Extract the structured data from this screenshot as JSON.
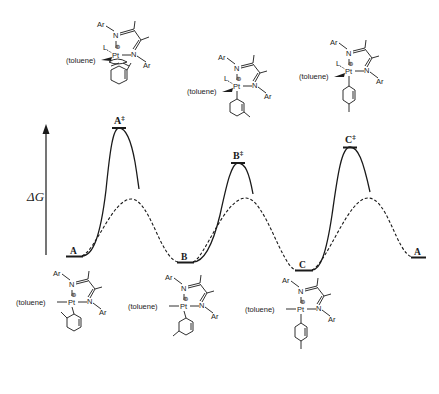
{
  "figure": {
    "type": "reaction free-energy profile",
    "axis": {
      "label": "ΔG",
      "direction": "up"
    },
    "colors": {
      "ink": "#1a1a1a",
      "background": "#ffffff"
    }
  },
  "states": {
    "A_start": {
      "label": "A",
      "x": 74,
      "y": 256
    },
    "A_ts": {
      "label": "A",
      "sup": "‡",
      "x": 119,
      "y": 127
    },
    "B": {
      "label": "B",
      "x": 185,
      "y": 262
    },
    "B_ts": {
      "label": "B",
      "sup": "‡",
      "x": 238,
      "y": 162
    },
    "C": {
      "label": "C",
      "x": 304,
      "y": 270
    },
    "C_ts": {
      "label": "C",
      "sup": "‡",
      "x": 350,
      "y": 147
    },
    "A_end": {
      "label": "A",
      "x": 418,
      "y": 257
    }
  },
  "curves": {
    "solid": {
      "style": "solid",
      "meaning": "uncatalyzed / higher barrier path"
    },
    "dashed": {
      "style": "dashed",
      "meaning": "lower barrier path"
    }
  },
  "structures": {
    "common": {
      "metal": "Pt",
      "charge": "⊕",
      "ligand_label": "(toluene)",
      "aryl_label": "Ar",
      "n_label": "N",
      "l_label": "L"
    },
    "A_ts": {
      "description": "ortho-tolyl Pt complex, η2 arene TS with L"
    },
    "B_ts": {
      "description": "meta-tolyl Pt complex TS with L"
    },
    "C_ts": {
      "description": "para-tolyl Pt complex TS with L"
    },
    "A": {
      "description": "(toluene)Pt ortho-tolyl diimine cation"
    },
    "B": {
      "description": "(toluene)Pt meta-tolyl diimine cation"
    },
    "C": {
      "description": "(toluene)Pt para-tolyl diimine cation"
    }
  }
}
